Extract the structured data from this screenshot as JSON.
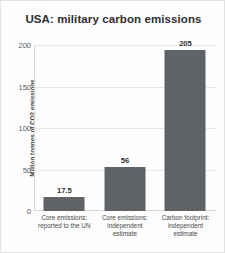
{
  "chart_data": {
    "type": "bar",
    "title": "USA: military carbon emissions",
    "xlabel": "",
    "ylabel": "Million tonnes of CO2 emissions",
    "categories": [
      "Core emissions: reported to the UN",
      "Core emissions: independent estimate",
      "Carbon footprint: independent estimate"
    ],
    "category_lines": [
      [
        "Core emissions:",
        "reported to the UN"
      ],
      [
        "Core emissions:",
        "independent",
        "estimate"
      ],
      [
        "Carbon footprint:",
        "independent",
        "estimate"
      ]
    ],
    "values": [
      17.5,
      56,
      205
    ],
    "value_labels": [
      "17.5",
      "56",
      "205"
    ],
    "ylim": [
      0,
      212
    ],
    "yticks": [
      0,
      50,
      100,
      150,
      200
    ],
    "ytick_labels": [
      "0",
      "50",
      "100",
      "150",
      "200"
    ],
    "grid": true,
    "legend": "none",
    "bar_color": "#5f6368",
    "grid_color": "#e8e8e8",
    "title_color": "#2f2f2f",
    "label_color": "#4a4a4a"
  }
}
